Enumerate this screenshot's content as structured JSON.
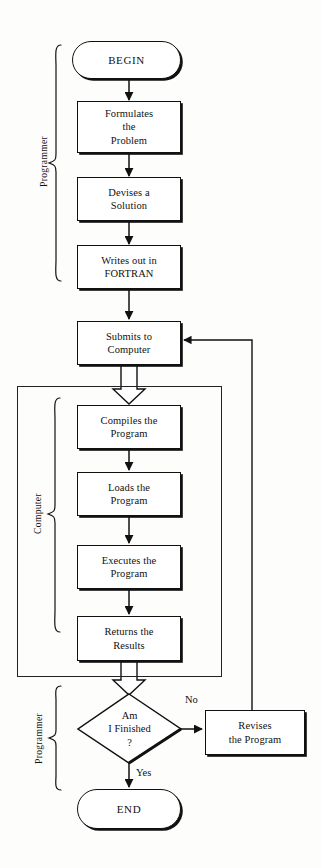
{
  "diagram": {
    "type": "flowchart",
    "colors": {
      "stroke": "#111111",
      "fill": "#ffffff",
      "background": "#fdfdfc"
    }
  },
  "swimlanes": [
    {
      "id": "programmer-top",
      "label": "Programmer",
      "shape": "left-brace"
    },
    {
      "id": "computer",
      "label": "Computer",
      "shape": "left-brace-with-box"
    },
    {
      "id": "programmer-bottom",
      "label": "Programmer",
      "shape": "left-brace"
    }
  ],
  "nodes": {
    "begin": {
      "label": "BEGIN",
      "shape": "terminator"
    },
    "formulates": {
      "lines": [
        "Formulates",
        "the",
        "Problem"
      ],
      "shape": "process"
    },
    "devises": {
      "lines": [
        "Devises a",
        "Solution"
      ],
      "shape": "process"
    },
    "writes": {
      "lines": [
        "Writes out in",
        "FORTRAN"
      ],
      "shape": "process"
    },
    "submits": {
      "lines": [
        "Submits to",
        "Computer"
      ],
      "shape": "process"
    },
    "compiles": {
      "lines": [
        "Compiles the",
        "Program"
      ],
      "shape": "process"
    },
    "loads": {
      "lines": [
        "Loads the",
        "Program"
      ],
      "shape": "process"
    },
    "executes": {
      "lines": [
        "Executes the",
        "Program"
      ],
      "shape": "process"
    },
    "returns": {
      "lines": [
        "Returns the",
        "Results"
      ],
      "shape": "process"
    },
    "decision": {
      "lines": [
        "Am",
        "I Finished",
        "?"
      ],
      "shape": "diamond"
    },
    "revises": {
      "lines": [
        "Revises",
        "the Program"
      ],
      "shape": "process"
    },
    "end": {
      "label": "END",
      "shape": "terminator"
    }
  },
  "edge_labels": {
    "no": "No",
    "yes": "Yes"
  }
}
